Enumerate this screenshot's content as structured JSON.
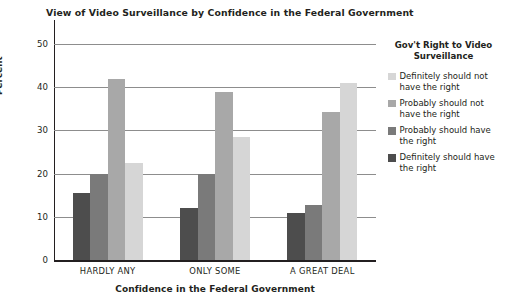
{
  "chart_data": {
    "type": "bar",
    "title": "View of Video Surveillance by Confidence in the Federal Government",
    "xlabel": "Confidence in the Federal Government",
    "ylabel": "Percent",
    "ylim": [
      0,
      50
    ],
    "yticks": [
      0,
      10,
      20,
      30,
      40,
      50
    ],
    "grid": true,
    "legend_position": "right",
    "legend_title": "Gov't Right to Video Surveillance",
    "categories": [
      "HARDLY ANY",
      "ONLY SOME",
      "A GREAT DEAL"
    ],
    "series": [
      {
        "name": "Definitely should not have the right",
        "color": "#4d4d4d",
        "values": [
          15.5,
          12.0,
          10.8
        ]
      },
      {
        "name": "Probably should not have the right",
        "color": "#7a7a7a",
        "values": [
          20.0,
          20.0,
          12.8
        ]
      },
      {
        "name": "Probably should have the right",
        "color": "#a8a8a8",
        "values": [
          42.0,
          39.0,
          34.3
        ]
      },
      {
        "name": "Definitely should have the right",
        "color": "#d6d6d6",
        "values": [
          22.5,
          28.5,
          41.0
        ]
      }
    ],
    "legend_order": [
      "Definitely should not have the right",
      "Probably should not have the right",
      "Probably should have the right",
      "Definitely should have the right"
    ],
    "legend_colors": [
      "#d6d6d6",
      "#a8a8a8",
      "#7a7a7a",
      "#4d4d4d"
    ],
    "legend_entries": [
      {
        "label": "Definitely should not have the right",
        "color": "#d6d6d6"
      },
      {
        "label": "Probably should not have the right",
        "color": "#a8a8a8"
      },
      {
        "label": "Probably should have the right",
        "color": "#7a7a7a"
      },
      {
        "label": "Definitely should have the right",
        "color": "#4d4d4d"
      }
    ]
  }
}
